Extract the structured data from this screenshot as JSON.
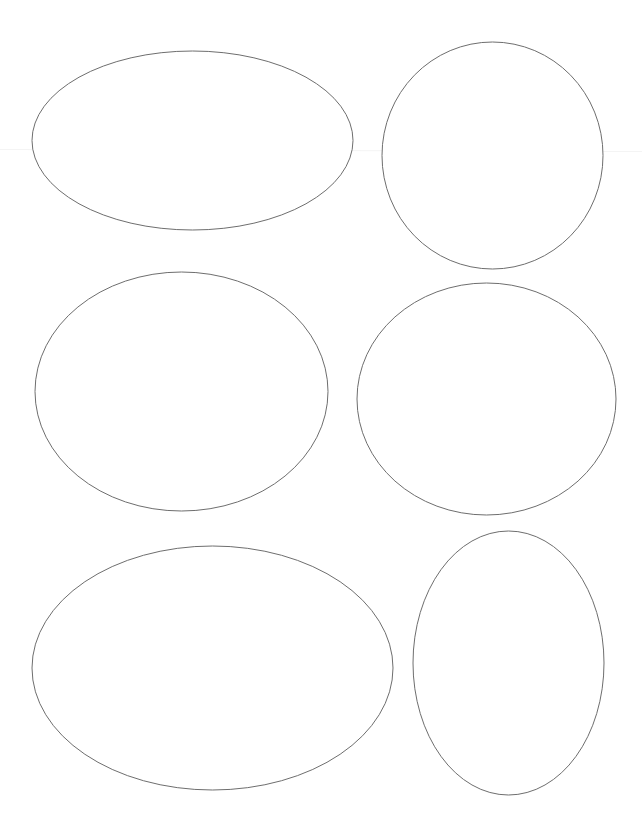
{
  "page": {
    "width": 642,
    "height": 835,
    "background": "#ffffff"
  },
  "style": {
    "stroke_color": "#6e6e6e",
    "stroke_width": 1,
    "fill": "#ffffff"
  },
  "shapes": [
    {
      "id": "ellipse-1",
      "type": "ellipse",
      "cx": 192.5,
      "cy": 140.5,
      "rx": 160.5,
      "ry": 89.5
    },
    {
      "id": "ellipse-2",
      "type": "ellipse",
      "cx": 492.5,
      "cy": 155.5,
      "rx": 110.5,
      "ry": 113.5
    },
    {
      "id": "ellipse-3",
      "type": "ellipse",
      "cx": 181.5,
      "cy": 391.5,
      "rx": 146.5,
      "ry": 119.5
    },
    {
      "id": "ellipse-4",
      "type": "ellipse",
      "cx": 486.5,
      "cy": 399,
      "rx": 129.5,
      "ry": 116
    },
    {
      "id": "ellipse-5",
      "type": "ellipse",
      "cx": 212.5,
      "cy": 668,
      "rx": 180.5,
      "ry": 122
    },
    {
      "id": "ellipse-6",
      "type": "ellipse",
      "cx": 508.5,
      "cy": 663,
      "rx": 95.5,
      "ry": 132
    }
  ]
}
